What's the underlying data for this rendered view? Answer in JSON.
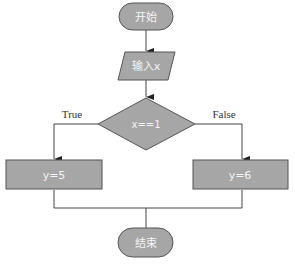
{
  "diagram": {
    "type": "flowchart",
    "colors": {
      "fill": "#a6a6a6",
      "stroke": "#555555",
      "text_inside": "#f4f4f4",
      "label": "#333333"
    },
    "nodes": {
      "start": {
        "shape": "terminal",
        "label": "开始"
      },
      "input": {
        "shape": "parallelogram",
        "label": "输入x"
      },
      "decision": {
        "shape": "diamond",
        "label": "x==1"
      },
      "true_branch": {
        "shape": "process",
        "label": "y=5"
      },
      "false_branch": {
        "shape": "process",
        "label": "y=6"
      },
      "end": {
        "shape": "terminal",
        "label": "结束"
      }
    },
    "edges": {
      "true_label": "True",
      "false_label": "False"
    }
  }
}
